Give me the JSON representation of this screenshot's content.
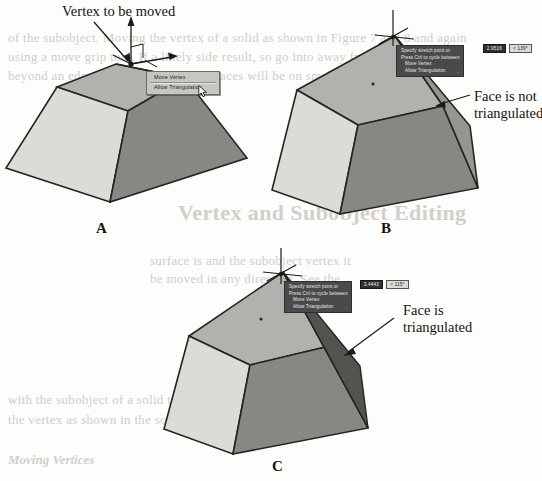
{
  "figure": {
    "title": "Vertex and Subobject Editing",
    "panels": [
      {
        "id": "A",
        "letter": "A",
        "caption_label": "Vertex to be moved",
        "description": "Frustum solid with move-gizmo at top vertex and context menu open"
      },
      {
        "id": "B",
        "letter": "B",
        "caption_label": "Face is not\ntriangulated",
        "description": "Vertex moved up, adjacent face remains a single warped quad"
      },
      {
        "id": "C",
        "letter": "C",
        "caption_label": "Face is\ntriangulated",
        "description": "Vertex moved up, adjacent face split into two triangles"
      }
    ]
  },
  "context_menu": {
    "name": "vertex-edit-context-menu",
    "items": [
      {
        "label": "Move Vertex",
        "selected": false
      },
      {
        "label": "Allow Triangulation",
        "selected": true
      }
    ],
    "cursor": "arrow-pointer"
  },
  "dynamic_input_b": {
    "lines": [
      "Specify stretch point or",
      "Press Ctrl to cycle between:",
      "Move Vertex",
      "Allow Triangulation"
    ],
    "ellipsis": "··",
    "fields": [
      {
        "value": "2.9516",
        "active": true
      },
      {
        "value": "< 139°",
        "active": false
      }
    ]
  },
  "dynamic_input_c": {
    "lines": [
      "Specify stretch point or",
      "Press Ctrl to cycle between:",
      "Move Vertex",
      "Allow Triangulation"
    ],
    "ellipsis": "··",
    "fields": [
      {
        "value": "3.4443",
        "active": true
      },
      {
        "value": "< 115°",
        "active": false
      }
    ]
  },
  "gizmo": {
    "name": "move-gizmo",
    "axes": [
      "z-axis-arrow",
      "x-axis-arrow",
      "y-axis-arrow"
    ],
    "grip": "vertex-grip"
  },
  "colors": {
    "face_light": "#d6d4cf",
    "face_medium": "#b0aeaa",
    "face_dark": "#8a8885",
    "face_darkest": "#6f6d6a",
    "outline": "#26241f",
    "menu_face": "#c8c6c2",
    "tooltip_bg": "#4a4a4a",
    "text": "#15130f",
    "ghost": "#c9c6c0"
  },
  "ghost_text": {
    "top_lines": [
      "of the subobject. Moving the vertex of  a solid as shown in Figure 7 and 8 and again",
      "using a move grip tool. If  a likely side result, so go into away from a solid will be",
      "beyond an edge, and the subobject of  faces will be on  smaller."
    ],
    "heading": "Vertex and Subobject Editing",
    "mid_lines": [
      "surface is and the subobject vertex it",
      "be moved in any direction. See the"
    ],
    "bottom_heading": "Moving Vertices",
    "bottom_lines": [
      "with the subobject of a solid to move",
      "the vertex as shown in the solid figure"
    ]
  }
}
